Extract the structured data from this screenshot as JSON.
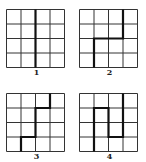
{
  "figure": {
    "grid_size": 4,
    "line_color": "#333333",
    "path_color": "#111111",
    "panels": [
      {
        "label": "1",
        "path": [
          [
            2,
            0
          ],
          [
            2,
            4
          ]
        ]
      },
      {
        "label": "2",
        "path": [
          [
            3,
            0
          ],
          [
            3,
            2
          ],
          [
            1,
            2
          ],
          [
            1,
            4
          ]
        ]
      },
      {
        "label": "3",
        "path": [
          [
            3,
            0
          ],
          [
            3,
            1
          ],
          [
            2,
            1
          ],
          [
            2,
            3
          ],
          [
            1,
            3
          ],
          [
            1,
            4
          ]
        ]
      },
      {
        "label": "4",
        "path": [
          [
            3,
            0
          ],
          [
            3,
            3
          ],
          [
            2,
            3
          ],
          [
            2,
            1
          ],
          [
            1,
            1
          ],
          [
            1,
            4
          ]
        ]
      }
    ]
  }
}
